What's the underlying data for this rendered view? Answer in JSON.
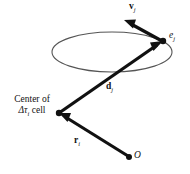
{
  "figure": {
    "background_color": "#ffffff",
    "stroke_color": "#111111",
    "ellipse_stroke_color": "#555555",
    "width": 190,
    "height": 174
  },
  "labels": {
    "velocity": {
      "symbol": "v",
      "subscript": "j"
    },
    "element": {
      "symbol": "e",
      "subscript": "j"
    },
    "distance": {
      "symbol": "d",
      "subscript": "j"
    },
    "position": {
      "symbol": "r",
      "subscript": "i"
    },
    "origin": {
      "symbol": "O"
    },
    "center": {
      "line1": "Center of",
      "delta": "Δτ",
      "subscript": "i",
      "line2_tail": " cell"
    }
  },
  "geometry": {
    "ellipse": {
      "cx": 112,
      "cy": 52,
      "rx": 60,
      "ry": 20
    },
    "nodes": [
      {
        "name": "element-node",
        "x": 163,
        "y": 41
      },
      {
        "name": "cell-center-node",
        "x": 59,
        "y": 113
      },
      {
        "name": "origin-node",
        "x": 129,
        "y": 157
      }
    ],
    "arrows": [
      {
        "name": "velocity-arrow",
        "x1": 162,
        "y1": 40,
        "x2": 125,
        "y2": 21
      },
      {
        "name": "distance-arrow",
        "x1": 59,
        "y1": 113,
        "x2": 160,
        "y2": 43
      },
      {
        "name": "position-arrow",
        "x1": 128,
        "y1": 156,
        "x2": 61,
        "y2": 114
      }
    ]
  }
}
